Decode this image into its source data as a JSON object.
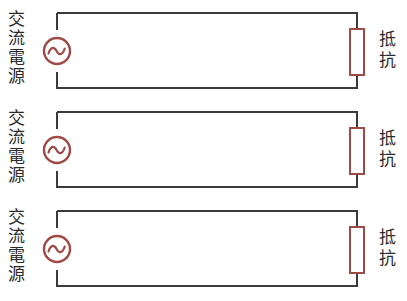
{
  "diagram": {
    "colors": {
      "wire": "#3a3a3a",
      "component": "#9e4a47",
      "component_fill": "#ffffff",
      "label_text": "#2b2b2b",
      "background": "#ffffff"
    },
    "labels": {
      "ac_source": "交流電源",
      "resistor": "抵抗"
    },
    "icons": {
      "ac_source": "ac-source-icon",
      "resistor": "resistor-icon"
    },
    "circuits": [
      {
        "id": "circuit-1",
        "source_label": "交流電源",
        "resistor_label": "抵抗",
        "top": 0
      },
      {
        "id": "circuit-2",
        "source_label": "交流電源",
        "resistor_label": "抵抗",
        "top": 99
      },
      {
        "id": "circuit-3",
        "source_label": "交流電源",
        "resistor_label": "抵抗",
        "top": 198
      }
    ]
  }
}
